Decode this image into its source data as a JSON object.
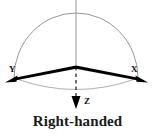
{
  "figure": {
    "caption": "Right-handed",
    "axes": [
      {
        "id": "y",
        "label": "Y",
        "label_x": 9,
        "label_y": 72
      },
      {
        "id": "x",
        "label": "X",
        "label_x": 131,
        "label_y": 72
      },
      {
        "id": "z",
        "label": "Z",
        "label_x": 84,
        "label_y": 104
      }
    ],
    "colors": {
      "axis": "#000000",
      "arc": "#8a8a8a",
      "dashed": "#2b2b2b",
      "text": "#1a1a1a",
      "background": "#ffffff"
    },
    "geometry": {
      "origin_x": 76,
      "origin_y": 67,
      "apex_y": 13,
      "vertical_line_top": 0,
      "z_arrow_tip_y": 109,
      "x_arrow_tip_x": 148,
      "x_arrow_tip_y": 82,
      "y_arrow_tip_x": 5,
      "y_arrow_tip_y": 82
    }
  }
}
